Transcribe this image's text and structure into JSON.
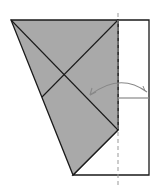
{
  "diagram": {
    "type": "origami-fold-step",
    "colors": {
      "background": "#ffffff",
      "paper_shaded": "#a9a9a9",
      "outline": "#1a1a1a",
      "fold_line": "#999999",
      "arrow": "#888888"
    },
    "shaded_polygon": "11,20 118,20 118,130 73,175",
    "white_region": "118,20 149,20 149,175 73,175 118,130",
    "crease_lines": [
      {
        "name": "diagonal-a",
        "x1": 11,
        "y1": 20,
        "x2": 118,
        "y2": 130
      },
      {
        "name": "diagonal-b",
        "x1": 118,
        "y1": 20,
        "x2": 42,
        "y2": 97
      }
    ],
    "valley_fold_line": {
      "x1": 118,
      "y1": 13,
      "x2": 118,
      "y2": 186
    },
    "reference_line": {
      "x1": 118,
      "y1": 98,
      "x2": 149,
      "y2": 98
    },
    "fold_arrow": {
      "path": "M 147 92 Q 120 72 90 95",
      "direction": "right-to-left"
    }
  }
}
